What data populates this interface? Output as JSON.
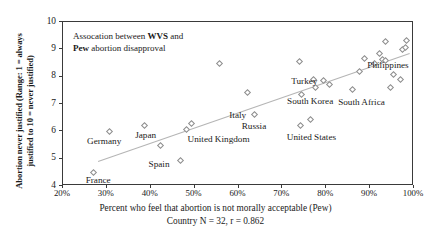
{
  "chart_data": {
    "type": "scatter",
    "title": "",
    "annotation_line1_pre": "Assocation between ",
    "annotation_line1_bold": "WVS",
    "annotation_line1_post": " and",
    "annotation_line2_bold": "Pew",
    "annotation_line2_post": " abortion disapproval",
    "annotation_full": "Assocation between WVS and Pew abortion disapproval",
    "xlabel": "Percent who feel that abortion is not morally acceptable (Pew)",
    "ylabel": "Abortion never justified (Range: 1 = always justified to 10 = never justified)",
    "ylabel_line1": "Abortion never justified (Range: 1 = always",
    "ylabel_line2": "justified to 10 = never justified)",
    "subcaption": "Country N = 32, r = 0.862",
    "n": 32,
    "r": 0.862,
    "xlim": [
      20,
      100
    ],
    "ylim": [
      4,
      10
    ],
    "xticks": [
      20,
      30,
      40,
      50,
      60,
      70,
      80,
      90,
      100
    ],
    "xticklabels": [
      "20%",
      "30%",
      "40%",
      "50%",
      "60%",
      "70%",
      "80%",
      "90%",
      "100%"
    ],
    "yticks": [
      4,
      5,
      6,
      7,
      8,
      9,
      10
    ],
    "yticklabels": [
      "4",
      "5",
      "6",
      "7",
      "8",
      "9",
      "10"
    ],
    "grid": false,
    "legend": "none",
    "marker_shape": "open-diamond",
    "marker_color": "#8d8d8d",
    "trendline": {
      "show": true,
      "color": "#b5b5b5",
      "x_start": 28,
      "y_start": 4.9,
      "x_end": 99,
      "y_end": 8.85
    },
    "points": [
      {
        "label": "France",
        "x": 27.0,
        "y": 4.5,
        "label_dx": -8,
        "label_dy": 8
      },
      {
        "label": "Germany",
        "x": 30.5,
        "y": 6.0,
        "label_dx": -22,
        "label_dy": 10
      },
      {
        "label": "Japan",
        "x": 38.5,
        "y": 6.22,
        "label_dx": -9,
        "label_dy": 10
      },
      {
        "label": "Spain",
        "x": 46.8,
        "y": 4.92,
        "label_dx": -32,
        "label_dy": 3
      },
      {
        "label": "United Kingdom",
        "x": 49.3,
        "y": 6.3,
        "label_dx": -4,
        "label_dy": 16
      },
      {
        "label": "",
        "x": 42.3,
        "y": 5.47,
        "label_dx": 0,
        "label_dy": 0
      },
      {
        "label": "",
        "x": 48.2,
        "y": 6.05,
        "label_dx": 0,
        "label_dy": 0
      },
      {
        "label": "",
        "x": 55.7,
        "y": 8.5,
        "label_dx": 0,
        "label_dy": 0
      },
      {
        "label": "Italy",
        "x": 62.0,
        "y": 7.42,
        "label_dx": -18,
        "label_dy": 22
      },
      {
        "label": "Russia",
        "x": 63.7,
        "y": 6.6,
        "label_dx": -13,
        "label_dy": 11
      },
      {
        "label": "United States",
        "x": 74.2,
        "y": 6.21,
        "label_dx": -14,
        "label_dy": 11
      },
      {
        "label": "",
        "x": 73.9,
        "y": 8.55,
        "label_dx": 0,
        "label_dy": 0
      },
      {
        "label": "Turkey",
        "x": 74.3,
        "y": 7.35,
        "label_dx": -10,
        "label_dy": -13
      },
      {
        "label": "",
        "x": 76.3,
        "y": 6.45,
        "label_dx": 0,
        "label_dy": 0
      },
      {
        "label": "South Korea",
        "x": 77.0,
        "y": 7.9,
        "label_dx": -26,
        "label_dy": 22
      },
      {
        "label": "",
        "x": 77.6,
        "y": 7.6,
        "label_dx": 0,
        "label_dy": 0
      },
      {
        "label": "",
        "x": 79.3,
        "y": 7.85,
        "label_dx": 0,
        "label_dy": 0
      },
      {
        "label": "",
        "x": 80.8,
        "y": 7.72,
        "label_dx": 0,
        "label_dy": 0
      },
      {
        "label": "South Africa",
        "x": 85.9,
        "y": 7.52,
        "label_dx": -14,
        "label_dy": 12
      },
      {
        "label": "",
        "x": 87.5,
        "y": 8.2,
        "label_dx": 0,
        "label_dy": 0
      },
      {
        "label": "",
        "x": 88.8,
        "y": 8.67,
        "label_dx": 0,
        "label_dy": 0
      },
      {
        "label": "",
        "x": 91.0,
        "y": 8.48,
        "label_dx": 0,
        "label_dy": 0
      },
      {
        "label": "Philippines",
        "x": 92.1,
        "y": 8.85,
        "label_dx": -12,
        "label_dy": 12
      },
      {
        "label": "",
        "x": 92.9,
        "y": 8.64,
        "label_dx": 0,
        "label_dy": 0
      },
      {
        "label": "",
        "x": 93.4,
        "y": 9.27,
        "label_dx": 0,
        "label_dy": 0
      },
      {
        "label": "",
        "x": 93.6,
        "y": 8.58,
        "label_dx": 0,
        "label_dy": 0
      },
      {
        "label": "",
        "x": 94.6,
        "y": 7.6,
        "label_dx": 0,
        "label_dy": 0
      },
      {
        "label": "",
        "x": 95.3,
        "y": 8.07,
        "label_dx": 0,
        "label_dy": 0
      },
      {
        "label": "",
        "x": 96.9,
        "y": 7.88,
        "label_dx": 0,
        "label_dy": 0
      },
      {
        "label": "",
        "x": 97.3,
        "y": 9.0,
        "label_dx": 0,
        "label_dy": 0
      },
      {
        "label": "",
        "x": 98.0,
        "y": 9.05,
        "label_dx": 0,
        "label_dy": 0
      },
      {
        "label": "",
        "x": 98.4,
        "y": 9.33,
        "label_dx": 0,
        "label_dy": 0
      }
    ]
  }
}
